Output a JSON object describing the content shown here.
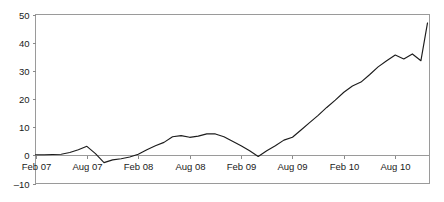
{
  "chart_data": {
    "type": "line",
    "title": "",
    "subtitle": "",
    "xlabel": "",
    "ylabel": "",
    "xlim": [
      0,
      46
    ],
    "ylim": [
      -10,
      50
    ],
    "yticks": [
      -10,
      0,
      10,
      20,
      30,
      40,
      50
    ],
    "ytick_labels": [
      "–10",
      "0",
      "10",
      "20",
      "30",
      "40",
      "50"
    ],
    "xticks": [
      0,
      6,
      12,
      18,
      24,
      30,
      36,
      42
    ],
    "xtick_labels": [
      "Feb 07",
      "Aug 07",
      "Feb 08",
      "Aug 08",
      "Feb 09",
      "Aug 09",
      "Feb 10",
      "Aug 10"
    ],
    "grid": false,
    "legend": false,
    "legend_position": "none",
    "line_color": "#1c1c1c",
    "frame_color": "#9a9a9a",
    "series": [
      {
        "name": "series-1",
        "x": [
          0,
          1,
          2,
          3,
          4,
          5,
          6,
          7,
          8,
          9,
          10,
          11,
          12,
          13,
          14,
          15,
          16,
          17,
          18,
          19,
          20,
          21,
          22,
          23,
          24,
          25,
          26,
          27,
          28,
          29,
          30,
          31,
          32,
          33,
          34,
          35,
          36,
          37,
          38,
          39,
          40,
          41,
          42,
          43,
          44,
          45
        ],
        "values": [
          0.2,
          0.2,
          0.3,
          0.4,
          1.0,
          2.0,
          3.2,
          0.6,
          -2.6,
          -1.6,
          -1.2,
          -0.6,
          0.4,
          2.0,
          3.4,
          4.6,
          6.6,
          7.0,
          6.4,
          6.8,
          7.6,
          7.6,
          6.6,
          5.0,
          3.4,
          1.6,
          -0.4,
          1.6,
          3.4,
          5.4,
          6.4,
          9.0,
          11.6,
          14.2,
          17.0,
          19.6,
          22.4,
          24.6,
          26.0,
          28.6,
          31.4,
          33.6,
          35.6,
          34.2,
          36.0,
          33.6
        ]
      }
    ],
    "annotations": [],
    "end_value": 47
  }
}
